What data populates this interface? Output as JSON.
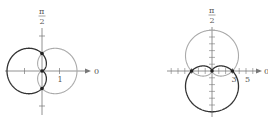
{
  "graphs": [
    {
      "id": "left",
      "origin": [
        42,
        71
      ],
      "unit": 17.5,
      "top_label_num": "π",
      "top_label_den": "2",
      "axis_label": "0",
      "tick_label": "1",
      "dark_curve": "r = 1 - cos θ",
      "light_curve": "r = 1 + cos θ",
      "dark_color": "#333333",
      "light_color": "#aaaaaa"
    },
    {
      "id": "right",
      "origin": [
        212,
        71
      ],
      "unit": 6.8,
      "top_label_num": "π",
      "top_label_den": "2",
      "axis_label": "0",
      "tick_label_a": "3",
      "tick_label_b": "5",
      "dark_curve": "r = 3 - 3 sin θ",
      "light_curve": "r = 3 + 3 sin θ",
      "dark_color": "#333333",
      "light_color": "#aaaaaa"
    }
  ]
}
